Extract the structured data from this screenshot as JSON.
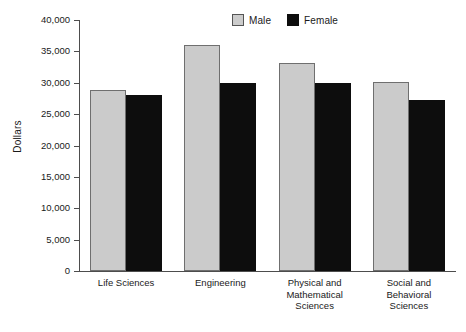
{
  "chart_data": {
    "type": "bar",
    "title": "",
    "xlabel": "",
    "ylabel": "Dollars",
    "ylim": [
      0,
      40000
    ],
    "grid": false,
    "legend_position": "top-center",
    "categories": [
      "Life Sciences",
      "Engineering",
      "Physical and Mathematical Sciences",
      "Social and Behavioral Sciences"
    ],
    "category_lines": [
      [
        "Life Sciences"
      ],
      [
        "Engineering"
      ],
      [
        "Physical and",
        "Mathematical",
        "Sciences"
      ],
      [
        "Social and",
        "Behavioral",
        "Sciences"
      ]
    ],
    "series": [
      {
        "name": "Male",
        "color": "#cbcbcb",
        "values": [
          28800,
          36000,
          33100,
          30100
        ]
      },
      {
        "name": "Female",
        "color": "#0d0d0d",
        "values": [
          28000,
          30000,
          30000,
          27200
        ]
      }
    ],
    "yticks": [
      0,
      5000,
      10000,
      15000,
      20000,
      25000,
      30000,
      35000,
      40000
    ],
    "ytick_labels": [
      "0",
      "5,000",
      "10,000",
      "15,000",
      "20,000",
      "25,000",
      "30,000",
      "35,000",
      "40,000"
    ]
  },
  "legend": {
    "entries": [
      {
        "label": "Male"
      },
      {
        "label": "Female"
      }
    ]
  }
}
